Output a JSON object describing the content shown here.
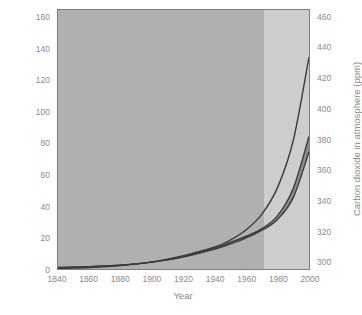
{
  "chart_data": {
    "type": "line",
    "title": "",
    "xlabel": "Year",
    "ylabel": "Cumulative input of carbon dioxide (ppm)",
    "ylabel_right": "Carbon dioxide in atmosphere (ppm)",
    "xlim": [
      1840,
      2000
    ],
    "ylim": [
      0,
      165
    ],
    "ylim_right": [
      295,
      465
    ],
    "xticks": [
      1840,
      1860,
      1880,
      1900,
      1920,
      1940,
      1960,
      1980,
      2000
    ],
    "xtick_labels": [
      "1840",
      "1860",
      "1880",
      "1900",
      "1920",
      "1940",
      "1960",
      "1980",
      "2000"
    ],
    "yticks": [
      0,
      20,
      40,
      60,
      80,
      100,
      120,
      140,
      160
    ],
    "ytick_labels": [
      "0",
      "20",
      "40",
      "60",
      "80",
      "100",
      "120",
      "140",
      "160"
    ],
    "yticks_right": [
      300,
      320,
      340,
      360,
      380,
      400,
      420,
      440,
      460
    ],
    "ytick_labels_right": [
      "300",
      "320",
      "340",
      "360",
      "380",
      "400",
      "420",
      "440",
      "460"
    ],
    "grid": false,
    "legend": "none",
    "shading": {
      "historical_color": "#b0b0b0",
      "projection_color": "#cdcdcd",
      "boundary_year": 1970,
      "band_color": "#8e8e8e"
    },
    "series": [
      {
        "name": "Cumulative input of carbon dioxide",
        "axis": "left",
        "color": "#3a3a3a",
        "x": [
          1840,
          1860,
          1880,
          1900,
          1920,
          1940,
          1950,
          1960,
          1970,
          1980,
          1990,
          2000
        ],
        "values": [
          0.4,
          1.0,
          2.2,
          4.5,
          8.5,
          14.0,
          18.5,
          25.0,
          35.0,
          52.0,
          82.0,
          135.0
        ]
      },
      {
        "name": "Carbon dioxide in atmosphere (upper bound)",
        "axis": "right",
        "color": "#3a3a3a",
        "x": [
          1840,
          1860,
          1880,
          1900,
          1920,
          1940,
          1950,
          1960,
          1970,
          1980,
          1990,
          2000
        ],
        "values": [
          296.0,
          296.5,
          297.5,
          299.5,
          303.0,
          308.5,
          312.5,
          316.5,
          321.5,
          330.0,
          348.0,
          382.0
        ]
      },
      {
        "name": "Carbon dioxide in atmosphere (lower bound)",
        "axis": "right",
        "color": "#3a3a3a",
        "x": [
          1840,
          1860,
          1880,
          1900,
          1920,
          1940,
          1950,
          1960,
          1970,
          1980,
          1990,
          2000
        ],
        "values": [
          296.0,
          296.5,
          297.5,
          299.5,
          303.0,
          308.0,
          311.5,
          315.5,
          320.5,
          327.5,
          342.0,
          372.0
        ]
      }
    ]
  },
  "caption": ""
}
